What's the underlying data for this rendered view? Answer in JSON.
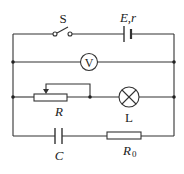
{
  "diagram": {
    "type": "circuit",
    "labels": {
      "switch": "S",
      "battery": "E,r",
      "voltmeter": "V",
      "rheostat": "R",
      "lamp": "L",
      "capacitor": "C",
      "resistor0": "R",
      "resistor0_sub": "0"
    },
    "components": [
      {
        "id": "S",
        "kind": "switch",
        "state": "open",
        "branch": "top"
      },
      {
        "id": "E,r",
        "kind": "battery",
        "branch": "top"
      },
      {
        "id": "V",
        "kind": "voltmeter",
        "branch": "second"
      },
      {
        "id": "R",
        "kind": "rheostat",
        "branch": "third"
      },
      {
        "id": "L",
        "kind": "lamp",
        "branch": "third"
      },
      {
        "id": "C",
        "kind": "capacitor",
        "branch": "bottom"
      },
      {
        "id": "R0",
        "kind": "resistor",
        "branch": "bottom"
      }
    ]
  }
}
